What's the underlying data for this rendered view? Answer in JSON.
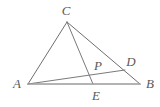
{
  "figure": {
    "type": "geometry-diagram",
    "background_color": "#ffffff",
    "canvas": {
      "width": 160,
      "height": 107
    },
    "stroke_colors": {
      "triangle_edges": "#6e6e6e",
      "base_line": "#9a9a9a",
      "cevian": "#7a7a7a"
    },
    "label_color": "#5a5a5a",
    "points": [
      {
        "id": "A",
        "label": "A",
        "x": 28,
        "y": 84,
        "label_x": 17,
        "label_y": 83
      },
      {
        "id": "B",
        "label": "B",
        "x": 140,
        "y": 84,
        "label_x": 150,
        "label_y": 83
      },
      {
        "id": "C",
        "label": "C",
        "x": 67,
        "y": 22,
        "label_x": 66,
        "label_y": 10
      },
      {
        "id": "D",
        "label": "D",
        "x": 125,
        "y": 70,
        "label_x": 131,
        "label_y": 61
      },
      {
        "id": "E",
        "label": "E",
        "x": 93,
        "y": 84,
        "label_x": 96,
        "label_y": 95
      },
      {
        "id": "P",
        "label": "P",
        "x": 93,
        "y": 72,
        "label_x": 98,
        "label_y": 65
      }
    ],
    "segments": [
      {
        "id": "CA",
        "from": "C",
        "to": "A",
        "style": "triangle_edge"
      },
      {
        "id": "CB",
        "from": "C",
        "to": "B",
        "style": "triangle_edge"
      },
      {
        "id": "AB",
        "from": "A",
        "to": "B",
        "style": "base_line"
      },
      {
        "id": "CE",
        "from": "C",
        "to": "E",
        "style": "cevian"
      },
      {
        "id": "AD",
        "from": "A",
        "to": "D",
        "style": "cevian"
      }
    ]
  }
}
